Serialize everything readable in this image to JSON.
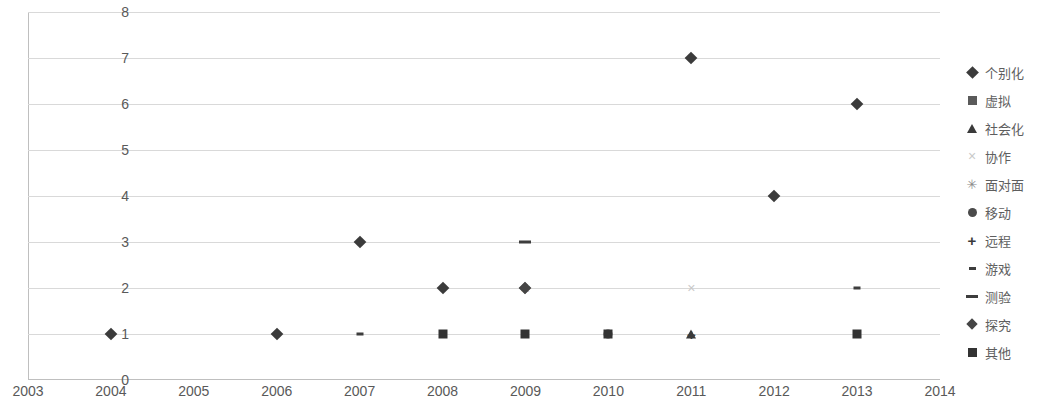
{
  "chart_data": {
    "type": "scatter",
    "title": "",
    "xlabel": "",
    "ylabel": "",
    "xlim": [
      2003,
      2014
    ],
    "ylim": [
      0,
      8
    ],
    "grid": true,
    "legend_position": "right",
    "x_ticks": [
      "2003",
      "2004",
      "2005",
      "2006",
      "2007",
      "2008",
      "2009",
      "2010",
      "2011",
      "2012",
      "2013",
      "2014"
    ],
    "y_ticks": [
      "0",
      "1",
      "2",
      "3",
      "4",
      "5",
      "6",
      "7",
      "8"
    ],
    "series": [
      {
        "name": "个别化",
        "marker": "diamond",
        "points": [
          [
            2004,
            1
          ],
          [
            2006,
            1
          ],
          [
            2007,
            3
          ],
          [
            2008,
            2
          ],
          [
            2009,
            2
          ],
          [
            2011,
            7
          ],
          [
            2012,
            4
          ],
          [
            2013,
            6
          ]
        ]
      },
      {
        "name": "虚拟",
        "marker": "square",
        "points": []
      },
      {
        "name": "社会化",
        "marker": "triangle",
        "points": [
          [
            2011,
            1
          ]
        ]
      },
      {
        "name": "协作",
        "marker": "cross",
        "points": [
          [
            2011,
            2
          ]
        ]
      },
      {
        "name": "面对面",
        "marker": "star",
        "points": [
          [
            2009,
            2
          ]
        ]
      },
      {
        "name": "移动",
        "marker": "circle",
        "points": [
          [
            2010,
            1
          ]
        ]
      },
      {
        "name": "远程",
        "marker": "plus",
        "points": [
          [
            2011,
            1
          ]
        ]
      },
      {
        "name": "游戏",
        "marker": "dash-small",
        "points": [
          [
            2007,
            1
          ],
          [
            2013,
            2
          ]
        ]
      },
      {
        "name": "测验",
        "marker": "dash-large",
        "points": [
          [
            2009,
            3
          ]
        ]
      },
      {
        "name": "探究",
        "marker": "diamond-small",
        "points": [
          [
            2009,
            2
          ]
        ]
      },
      {
        "name": "其他",
        "marker": "square-filled",
        "points": [
          [
            2008,
            1
          ],
          [
            2009,
            1
          ],
          [
            2010,
            1
          ],
          [
            2013,
            1
          ]
        ]
      }
    ]
  },
  "legend": {
    "items": [
      {
        "label": "个别化",
        "marker": "diamond-icon"
      },
      {
        "label": "虚拟",
        "marker": "square-icon"
      },
      {
        "label": "社会化",
        "marker": "triangle-icon"
      },
      {
        "label": "协作",
        "marker": "cross-icon"
      },
      {
        "label": "面对面",
        "marker": "star-icon"
      },
      {
        "label": "移动",
        "marker": "circle-icon"
      },
      {
        "label": "远程",
        "marker": "plus-icon"
      },
      {
        "label": "游戏",
        "marker": "dash-small-icon"
      },
      {
        "label": "测验",
        "marker": "dash-large-icon"
      },
      {
        "label": "探究",
        "marker": "diamond-small-icon"
      },
      {
        "label": "其他",
        "marker": "square-filled-icon"
      }
    ]
  },
  "colors": {
    "gridline": "#d9d9d9",
    "axis": "#bfbfbf",
    "tick_text": "#595959",
    "legend_text": "#5e5e5e",
    "marker_dark": "#3b3b3b",
    "marker_light": "#c9c9c9"
  }
}
